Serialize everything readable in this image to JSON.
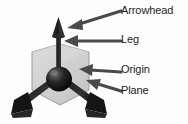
{
  "diagram": {
    "background_color": "#fefefe",
    "ink_color": "#1c1c1c",
    "pointer_color": "#4a4a4a",
    "plane_fill": "#d0d0d0",
    "plane_stroke": "#8a8a8a",
    "shaft_color": "#2b2b2b",
    "origin_color": "#111111"
  },
  "labels": {
    "arrowhead": "Arrowhead",
    "leg": "Leg",
    "origin": "Origin",
    "plane": "Plane"
  },
  "parts": {
    "vertical_arrow": "vertical-axis-arrow",
    "left_leg": "lower-left-leg-arrow",
    "right_leg": "lower-right-leg-arrow",
    "origin_sphere": "origin-sphere",
    "plane_hexagon": "plane-hexagon"
  },
  "pointers": {
    "arrowhead": "pointer-arrow-arrowhead",
    "leg": "pointer-arrow-leg",
    "origin": "pointer-arrow-origin",
    "plane": "pointer-arrow-plane"
  }
}
